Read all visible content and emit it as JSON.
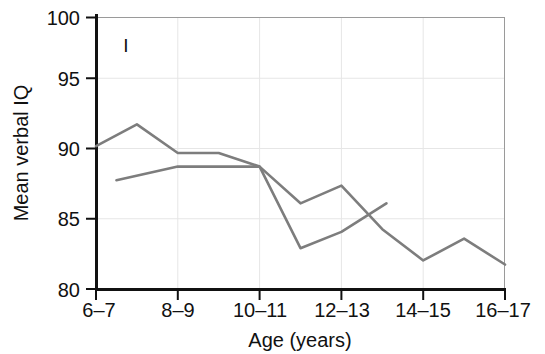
{
  "chart_data": {
    "type": "line",
    "title": "",
    "panel_label": "I",
    "xlabel": "Age (years)",
    "ylabel": "Mean verbal IQ",
    "categories": [
      "6–7",
      "8–9",
      "10–11",
      "12–13",
      "14–15",
      "16–17"
    ],
    "x_tick_labels": [
      "6–7",
      "8–9",
      "10–11",
      "12–13",
      "14–15",
      "16–17"
    ],
    "y_tick_labels": [
      "80",
      "85",
      "90",
      "95",
      "100"
    ],
    "y_tick_values": [
      80,
      85,
      90,
      95,
      100
    ],
    "ylim": [
      80,
      100
    ],
    "grid": true,
    "legend": "none",
    "series": [
      {
        "name": "series-1",
        "color": "#7d7d7d",
        "points": [
          {
            "x": 6.0,
            "y": 90.5
          },
          {
            "x": 7.0,
            "y": 92.1
          },
          {
            "x": 8.0,
            "y": 90.0
          },
          {
            "x": 9.0,
            "y": 90.0
          },
          {
            "x": 10.0,
            "y": 89.0
          },
          {
            "x": 11.0,
            "y": 86.3
          },
          {
            "x": 12.0,
            "y": 87.6
          },
          {
            "x": 13.0,
            "y": 84.4
          },
          {
            "x": 14.0,
            "y": 82.1
          },
          {
            "x": 15.0,
            "y": 83.7
          },
          {
            "x": 16.0,
            "y": 81.8
          }
        ]
      },
      {
        "name": "series-2",
        "color": "#7d7d7d",
        "points": [
          {
            "x": 6.5,
            "y": 88.0
          },
          {
            "x": 8.0,
            "y": 89.0
          },
          {
            "x": 9.0,
            "y": 89.0
          },
          {
            "x": 10.0,
            "y": 89.0
          },
          {
            "x": 11.0,
            "y": 83.0
          },
          {
            "x": 12.0,
            "y": 84.2
          },
          {
            "x": 13.1,
            "y": 86.3
          }
        ]
      }
    ]
  }
}
